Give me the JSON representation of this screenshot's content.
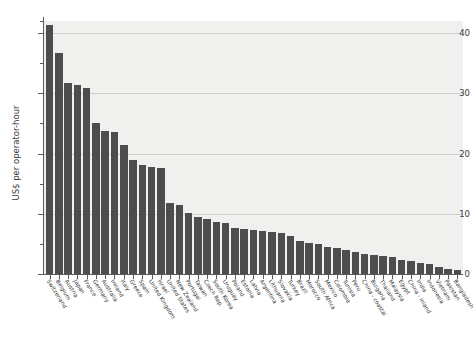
{
  "chart_data": {
    "type": "bar",
    "title": "",
    "subtitle": "",
    "xlabel": "",
    "ylabel": "US$ per operator-hour",
    "ylim": [
      0,
      42
    ],
    "ytick_labels": [
      "0",
      "10",
      "20",
      "30",
      "40"
    ],
    "ytick_values": [
      0,
      10,
      20,
      30,
      40
    ],
    "yminor_values": [
      5,
      15,
      25,
      35
    ],
    "grid": "horizontal",
    "legend": "none",
    "bar_color": "#4d4d4d",
    "plot_background": "#f0f0ef",
    "categories": [
      "Switzerland",
      "Belgium",
      "Austria",
      "Japan",
      "France",
      "Germany",
      "Australia",
      "Ireland",
      "Italy",
      "Greece",
      "Spain",
      "United Kingdom",
      "Israel",
      "United States",
      "New Zealand",
      "Portugal",
      "Taiwan",
      "Czech Rep.",
      "South Korea",
      "Uruguay",
      "Poland",
      "Estonia",
      "Latvia",
      "Argentina",
      "Lithuania",
      "Slovakia",
      "Turkey",
      "Brazil",
      "Morocco",
      "South Africa",
      "Mexico",
      "Colombia",
      "Tunisia",
      "Peru",
      "China - coastal",
      "Bulgaria",
      "Thailand",
      "Malaysia",
      "Egypt",
      "China - inland",
      "India",
      "Indonesia",
      "Vietnam",
      "Pakistan",
      "Bangladesh"
    ],
    "values": [
      41.3,
      36.7,
      31.7,
      31.3,
      30.9,
      25.0,
      23.7,
      23.6,
      21.5,
      19.0,
      18.1,
      17.8,
      17.6,
      11.8,
      11.5,
      10.2,
      9.5,
      9.2,
      8.7,
      8.4,
      7.6,
      7.5,
      7.3,
      7.2,
      7.0,
      6.8,
      6.3,
      5.5,
      5.2,
      5.0,
      4.5,
      4.3,
      4.0,
      3.6,
      3.4,
      3.2,
      3.0,
      2.8,
      2.4,
      2.1,
      1.8,
      1.6,
      1.2,
      0.9,
      0.6
    ]
  }
}
